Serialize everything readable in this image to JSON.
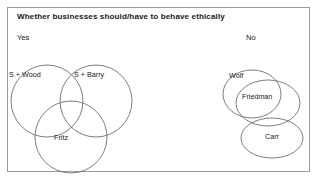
{
  "slide": {
    "title": "Whether businesses should/have to behave ethically",
    "background_color": "#ffffff",
    "frame_border_color": "#9a9a9a",
    "shape_stroke_color": "#6f6f6f",
    "text_color": "#1a1a1a"
  },
  "branches": {
    "left_label": "Yes",
    "right_label": "No"
  },
  "diagram_data": {
    "type": "venn",
    "groups": [
      {
        "name": "yes-group",
        "branch": "Yes",
        "sets": [
          {
            "label": "S + Wood",
            "shape": "circle"
          },
          {
            "label": "S + Barry",
            "shape": "circle"
          },
          {
            "label": "Fritz",
            "shape": "circle"
          }
        ],
        "arrangement": "three overlapping circles, two on top and one below centered"
      },
      {
        "name": "no-group",
        "branch": "No",
        "sets": [
          {
            "label": "Wolf",
            "shape": "ellipse"
          },
          {
            "label": "Friedman",
            "shape": "ellipse"
          },
          {
            "label": "Carr",
            "shape": "ellipse"
          }
        ],
        "arrangement": "Wolf and Friedman strongly overlapping, Carr below overlapping Friedman"
      }
    ]
  }
}
